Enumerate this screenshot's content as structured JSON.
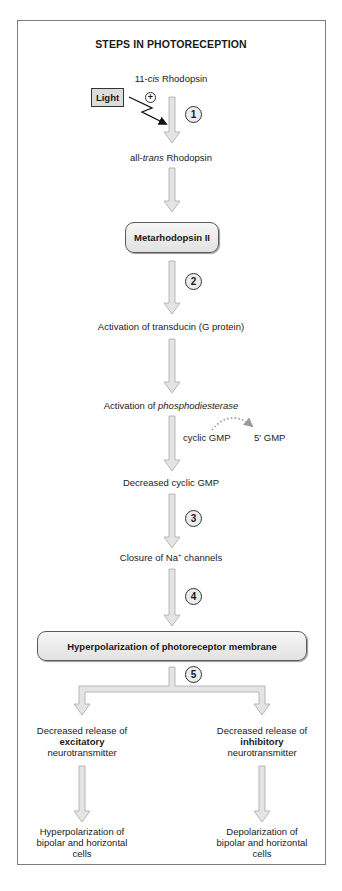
{
  "diagram": {
    "title": "STEPS IN PHOTORECEPTION",
    "colors": {
      "arrow_fill": "#e4e4e4",
      "arrow_stroke": "#a8a8a8",
      "box_fill": "#ececec",
      "frame_border": "#7d7d7d",
      "light_box_fill": "#dcdcdc"
    },
    "stimulus": {
      "label": "Light",
      "effect_sign": "+"
    },
    "nodes": {
      "rhodopsin_11cis": {
        "prefix": "11-",
        "italic": "cis",
        "suffix": " Rhodopsin"
      },
      "rhodopsin_alltrans": {
        "prefix": "all-",
        "italic": "trans",
        "suffix": " Rhodopsin"
      },
      "metarhodopsin": {
        "label": "Metarhodopsin II"
      },
      "transducin": {
        "label": "Activation of transducin (G protein)"
      },
      "phosphodiesterase": {
        "prefix": "Activation of ",
        "italic": "phosphodiesterase"
      },
      "cgmp_conversion": {
        "from": "cyclic GMP",
        "to": "5' GMP"
      },
      "decreased_cgmp": {
        "label": "Decreased cyclic GMP"
      },
      "na_channels": {
        "prefix": "Closure of Na",
        "superscript": "+",
        "suffix": " channels"
      },
      "hyperpolarization": {
        "label": "Hyperpolarization of photoreceptor membrane"
      }
    },
    "steps": [
      "1",
      "2",
      "3",
      "4",
      "5"
    ],
    "branches": {
      "left": {
        "line1": "Decreased release of",
        "bold": "excitatory",
        "line3": "neurotransmitter",
        "outcome": [
          "Hyperpolarization of",
          "bipolar and horizontal",
          "cells"
        ]
      },
      "right": {
        "line1": "Decreased release of",
        "bold": "inhibitory",
        "line3": "neurotransmitter",
        "outcome": [
          "Depolarization of",
          "bipolar and horizontal",
          "cells"
        ]
      }
    }
  }
}
